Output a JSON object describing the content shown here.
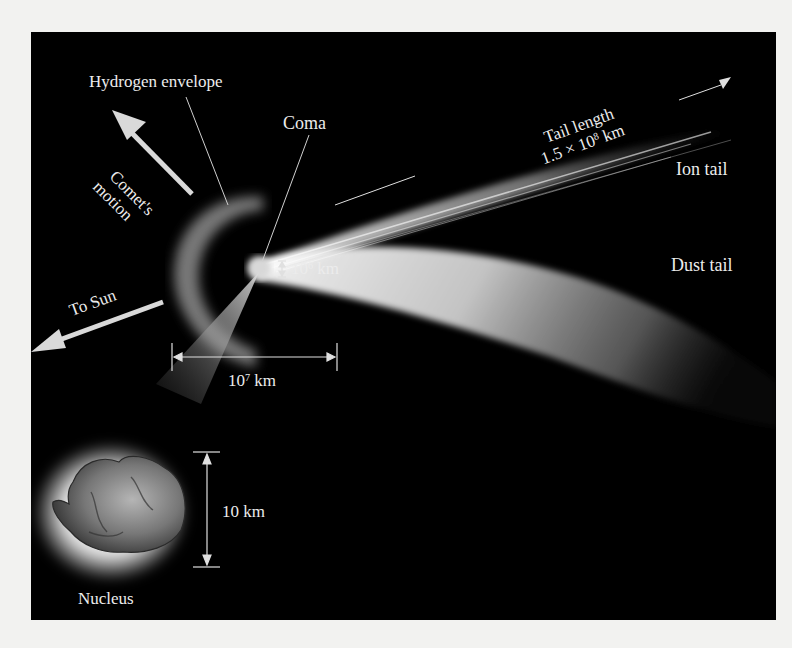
{
  "diagram": {
    "labels": {
      "hydrogen_envelope": "Hydrogen envelope",
      "coma": "Coma",
      "comets_motion_line1": "Comet's",
      "comets_motion_line2": "motion",
      "to_sun": "To Sun",
      "tail_length_line1": "Tail length",
      "tail_length_value": "1.5 × 10",
      "tail_length_exp": "8",
      "tail_length_unit": " km",
      "ion_tail": "Ion tail",
      "dust_tail": "Dust tail",
      "coma_size_base": "10",
      "coma_size_exp": "6",
      "coma_size_unit": " km",
      "envelope_size_base": "10",
      "envelope_size_exp": "7",
      "envelope_size_unit": " km",
      "nucleus_size": "10 km",
      "nucleus": "Nucleus"
    },
    "colors": {
      "background": "#000000",
      "page": "#f2f2f0",
      "label": "#ececec",
      "arrow": "#d9d9d9"
    }
  }
}
